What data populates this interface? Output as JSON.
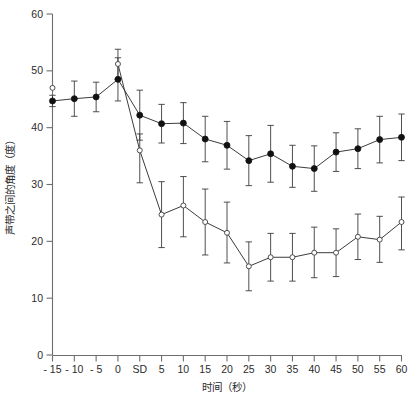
{
  "chart_data": {
    "type": "line",
    "title": "",
    "xlabel": "时间（秒）",
    "ylabel": "声带之间的角度（度）",
    "categories": [
      "-15",
      "-10",
      "-5",
      "0",
      "SD",
      "5",
      "10",
      "15",
      "20",
      "25",
      "30",
      "35",
      "40",
      "45",
      "50",
      "55",
      "60"
    ],
    "xtick_labels": [
      "- 15",
      "- 10",
      "- 5",
      "0",
      "SD",
      "5",
      "10",
      "15",
      "20",
      "25",
      "30",
      "35",
      "40",
      "45",
      "50",
      "55",
      "60"
    ],
    "ytick_labels": [
      "0",
      "10",
      "20",
      "30",
      "40",
      "50",
      "60"
    ],
    "ytick_values": [
      0,
      10,
      20,
      30,
      40,
      50,
      60
    ],
    "ylim": [
      0,
      60
    ],
    "grid": false,
    "legend": "none",
    "series": [
      {
        "name": "filled-circle-series",
        "marker": "filled-circle",
        "values": [
          44.7,
          45.1,
          45.4,
          48.5,
          42.2,
          40.7,
          40.8,
          38.0,
          36.9,
          34.2,
          35.4,
          33.2,
          32.8,
          35.7,
          36.3,
          37.9,
          38.3
        ],
        "err_upper": [
          1.0,
          3.1,
          2.6,
          3.8,
          4.4,
          3.4,
          3.6,
          4.0,
          4.2,
          4.4,
          5.0,
          3.7,
          4.0,
          3.4,
          3.5,
          4.1,
          4.1
        ],
        "err_lower": [
          1.0,
          3.1,
          2.6,
          3.8,
          4.4,
          3.4,
          3.6,
          4.0,
          4.2,
          4.4,
          5.0,
          3.7,
          4.0,
          3.4,
          3.5,
          4.1,
          4.1
        ]
      },
      {
        "name": "open-marker-series",
        "marker": "open-circle",
        "values": [
          47.0,
          null,
          null,
          51.2,
          36.0,
          24.7,
          26.3,
          23.4,
          21.5,
          15.6,
          17.2,
          17.2,
          18.0,
          18.0,
          20.8,
          20.3,
          23.4
        ],
        "err_upper": [
          0.0,
          null,
          null,
          2.6,
          2.9,
          5.8,
          5.1,
          5.8,
          5.4,
          4.3,
          4.2,
          4.2,
          4.5,
          4.2,
          4.0,
          4.1,
          4.4
        ],
        "err_lower": [
          0.0,
          null,
          null,
          2.6,
          5.7,
          5.8,
          5.5,
          5.8,
          5.3,
          4.3,
          4.2,
          4.2,
          4.4,
          4.2,
          4.0,
          4.0,
          4.9
        ]
      }
    ]
  },
  "axes": {
    "y_title": "声带之间的角度（度）",
    "x_title": "时间（秒）"
  },
  "colors": {
    "axis": "#6e6e6e",
    "line": "#3c3c3c",
    "filled_marker": "#111111",
    "open_marker_fill": "#ffffff",
    "background": "#ffffff"
  }
}
